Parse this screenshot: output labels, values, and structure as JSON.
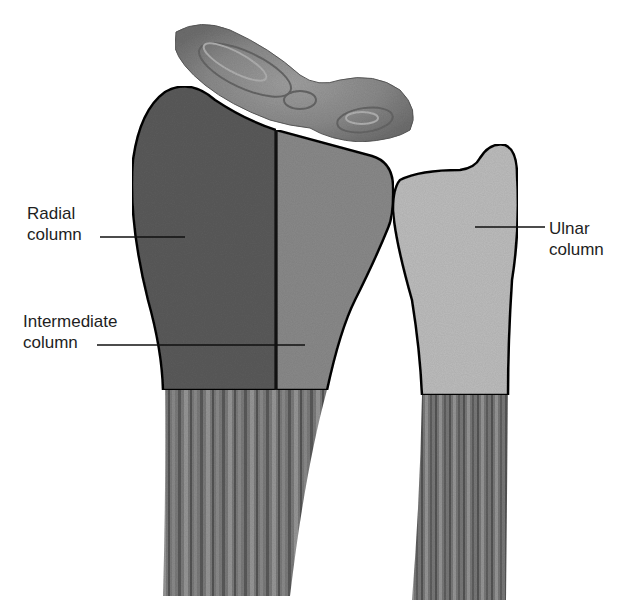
{
  "figure": {
    "labels": {
      "radial": {
        "line1": "Radial",
        "line2": "column"
      },
      "intermediate": {
        "line1": "Intermediate",
        "line2": "column"
      },
      "ulnar": {
        "line1": "Ulnar",
        "line2": "column"
      }
    },
    "colors": {
      "radial_column": "#5c5c5c",
      "intermediate_column": "#8a8a8a",
      "ulnar_column": "#bdbdbd",
      "shaft": "#7a7a7a",
      "carpal": "#8c8c8c",
      "outline": "#111111",
      "label_text": "#1e1e1e"
    }
  }
}
